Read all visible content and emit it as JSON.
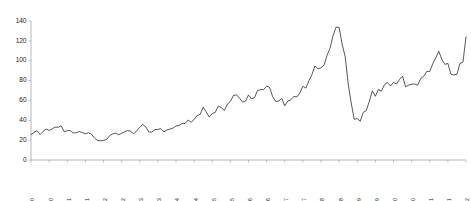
{
  "chart_data": {
    "type": "line",
    "title": "",
    "subtitle": "",
    "xlabel": "",
    "ylabel": "",
    "ylim": [
      0,
      140
    ],
    "yticks": [
      0,
      20,
      40,
      60,
      80,
      100,
      120,
      140
    ],
    "grid": false,
    "legend": null,
    "legend_position": "none",
    "line_color": "#2b2b2b",
    "axis_color": "#9a9a9a",
    "x_tick_labels": [
      "Jan-00",
      "Jul-00",
      "Jan-01",
      "Jul-01",
      "Jan-02",
      "Jul-02",
      "Jan-03",
      "Jul-03",
      "Jan-04",
      "Jul-04",
      "Jan-05",
      "Jul-05",
      "Jan-06",
      "Jul-06",
      "Jan-07",
      "Jul-07",
      "Jan-08",
      "Jul-08",
      "Jan-09",
      "Jul-09",
      "Jan-10",
      "Jul-10",
      "Jan-11",
      "Jul-11",
      "Jan-12"
    ],
    "x_tick_step_months": 6,
    "x": [
      "Jan-00",
      "Feb-00",
      "Mar-00",
      "Apr-00",
      "May-00",
      "Jun-00",
      "Jul-00",
      "Aug-00",
      "Sep-00",
      "Oct-00",
      "Nov-00",
      "Dec-00",
      "Jan-01",
      "Feb-01",
      "Mar-01",
      "Apr-01",
      "May-01",
      "Jun-01",
      "Jul-01",
      "Aug-01",
      "Sep-01",
      "Oct-01",
      "Nov-01",
      "Dec-01",
      "Jan-02",
      "Feb-02",
      "Mar-02",
      "Apr-02",
      "May-02",
      "Jun-02",
      "Jul-02",
      "Aug-02",
      "Sep-02",
      "Oct-02",
      "Nov-02",
      "Dec-02",
      "Jan-03",
      "Feb-03",
      "Mar-03",
      "Apr-03",
      "May-03",
      "Jun-03",
      "Jul-03",
      "Aug-03",
      "Sep-03",
      "Oct-03",
      "Nov-03",
      "Dec-03",
      "Jan-04",
      "Feb-04",
      "Mar-04",
      "Apr-04",
      "May-04",
      "Jun-04",
      "Jul-04",
      "Aug-04",
      "Sep-04",
      "Oct-04",
      "Nov-04",
      "Dec-04",
      "Jan-05",
      "Feb-05",
      "Mar-05",
      "Apr-05",
      "May-05",
      "Jun-05",
      "Jul-05",
      "Aug-05",
      "Sep-05",
      "Oct-05",
      "Nov-05",
      "Dec-05",
      "Jan-06",
      "Feb-06",
      "Mar-06",
      "Apr-06",
      "May-06",
      "Jun-06",
      "Jul-06",
      "Aug-06",
      "Sep-06",
      "Oct-06",
      "Nov-06",
      "Dec-06",
      "Jan-07",
      "Feb-07",
      "Mar-07",
      "Apr-07",
      "May-07",
      "Jun-07",
      "Jul-07",
      "Aug-07",
      "Sep-07",
      "Oct-07",
      "Nov-07",
      "Dec-07",
      "Jan-08",
      "Feb-08",
      "Mar-08",
      "Apr-08",
      "May-08",
      "Jun-08",
      "Jul-08",
      "Aug-08",
      "Sep-08",
      "Oct-08",
      "Nov-08",
      "Dec-08",
      "Jan-09",
      "Feb-09",
      "Mar-09",
      "Apr-09",
      "May-09",
      "Jun-09",
      "Jul-09",
      "Aug-09",
      "Sep-09",
      "Oct-09",
      "Nov-09",
      "Dec-09",
      "Jan-10",
      "Feb-10",
      "Mar-10",
      "Apr-10",
      "May-10",
      "Jun-10",
      "Jul-10",
      "Aug-10",
      "Sep-10",
      "Oct-10",
      "Nov-10",
      "Dec-10",
      "Jan-11",
      "Feb-11",
      "Mar-11",
      "Apr-11",
      "May-11",
      "Jun-11",
      "Jul-11",
      "Aug-11",
      "Sep-11",
      "Oct-11",
      "Nov-11",
      "Dec-11",
      "Jan-12"
    ],
    "values": [
      25.5,
      27.8,
      29.5,
      25.6,
      28.8,
      31.2,
      29.8,
      31.2,
      33.1,
      33.0,
      34.4,
      28.5,
      29.6,
      29.6,
      27.3,
      27.5,
      28.6,
      27.6,
      26.4,
      27.4,
      26.2,
      22.2,
      19.7,
      19.3,
      19.7,
      20.7,
      24.4,
      26.3,
      27.0,
      25.5,
      26.9,
      28.4,
      29.7,
      28.9,
      26.3,
      29.5,
      33.0,
      35.8,
      33.5,
      28.2,
      28.1,
      30.7,
      30.8,
      31.6,
      28.3,
      30.3,
      31.1,
      32.1,
      34.3,
      34.7,
      36.8,
      36.7,
      40.3,
      38.0,
      40.8,
      44.9,
      45.9,
      53.3,
      48.5,
      43.2,
      46.8,
      48.0,
      54.2,
      53.0,
      49.8,
      56.3,
      59.0,
      65.0,
      65.6,
      62.4,
      58.3,
      59.4,
      65.5,
      61.6,
      62.9,
      70.0,
      70.9,
      71.0,
      74.4,
      73.1,
      63.8,
      58.9,
      59.4,
      62.0,
      54.6,
      59.3,
      60.6,
      64.0,
      63.5,
      67.5,
      74.2,
      72.4,
      79.9,
      86.0,
      94.8,
      91.7,
      93.0,
      95.4,
      105.5,
      112.6,
      125.4,
      133.9,
      133.4,
      116.6,
      104.1,
      76.6,
      57.4,
      41.0,
      41.7,
      39.1,
      48.0,
      49.8,
      59.2,
      69.6,
      64.2,
      71.1,
      69.4,
      75.8,
      78.1,
      74.6,
      78.3,
      76.4,
      81.2,
      84.5,
      73.7,
      75.4,
      76.3,
      76.6,
      75.3,
      81.9,
      84.3,
      89.2,
      89.2,
      97.0,
      103.0,
      109.5,
      101.3,
      96.3,
      97.3,
      86.3,
      85.6,
      86.4,
      97.2,
      98.6,
      124.0
    ],
    "series": [
      {
        "name": "",
        "values": [
          25.5,
          27.8,
          29.5,
          25.6,
          28.8,
          31.2,
          29.8,
          31.2,
          33.1,
          33.0,
          34.4,
          28.5,
          29.6,
          29.6,
          27.3,
          27.5,
          28.6,
          27.6,
          26.4,
          27.4,
          26.2,
          22.2,
          19.7,
          19.3,
          19.7,
          20.7,
          24.4,
          26.3,
          27.0,
          25.5,
          26.9,
          28.4,
          29.7,
          28.9,
          26.3,
          29.5,
          33.0,
          35.8,
          33.5,
          28.2,
          28.1,
          30.7,
          30.8,
          31.6,
          28.3,
          30.3,
          31.1,
          32.1,
          34.3,
          34.7,
          36.8,
          36.7,
          40.3,
          38.0,
          40.8,
          44.9,
          45.9,
          53.3,
          48.5,
          43.2,
          46.8,
          48.0,
          54.2,
          53.0,
          49.8,
          56.3,
          59.0,
          65.0,
          65.6,
          62.4,
          58.3,
          59.4,
          65.5,
          61.6,
          62.9,
          70.0,
          70.9,
          71.0,
          74.4,
          73.1,
          63.8,
          58.9,
          59.4,
          62.0,
          54.6,
          59.3,
          60.6,
          64.0,
          63.5,
          67.5,
          74.2,
          72.4,
          79.9,
          86.0,
          94.8,
          91.7,
          93.0,
          95.4,
          105.5,
          112.6,
          125.4,
          133.9,
          133.4,
          116.6,
          104.1,
          76.6,
          57.4,
          41.0,
          41.7,
          39.1,
          48.0,
          49.8,
          59.2,
          69.6,
          64.2,
          71.1,
          69.4,
          75.8,
          78.1,
          74.6,
          78.3,
          76.4,
          81.2,
          84.5,
          73.7,
          75.4,
          76.3,
          76.6,
          75.3,
          81.9,
          84.3,
          89.2,
          89.2,
          97.0,
          103.0,
          109.5,
          101.3,
          96.3,
          97.3,
          86.3,
          85.6,
          86.4,
          97.2,
          98.6,
          124.0
        ]
      }
    ]
  }
}
